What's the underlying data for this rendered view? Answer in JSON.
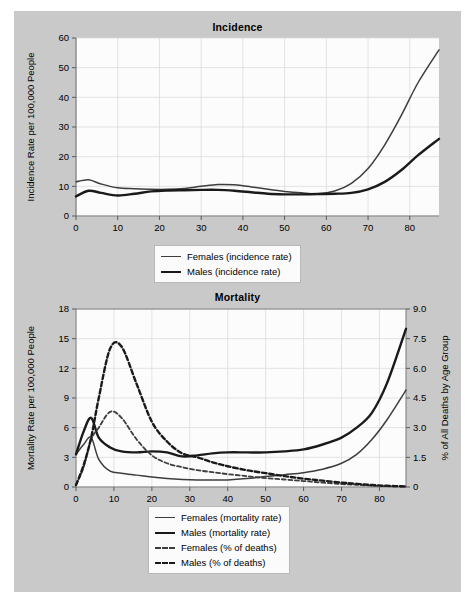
{
  "figure": {
    "background_color": "#c9c9c9",
    "page_color": "#ffffff"
  },
  "charts": {
    "incidence": {
      "title": "Incidence",
      "ylabel": "Incidence Rate per 100,000 People",
      "xlabel": "",
      "yticks": [
        "0",
        "10",
        "20",
        "30",
        "40",
        "50",
        "60"
      ],
      "xticks": [
        "0",
        "10",
        "20",
        "30",
        "40",
        "50",
        "60",
        "70",
        "80"
      ],
      "legend": [
        {
          "label": "Females (incidence rate)",
          "style": "solid-thin",
          "color": "#3d3d3d"
        },
        {
          "label": "Males (incidence rate)",
          "style": "solid-thick",
          "color": "#1a1a1a"
        }
      ]
    },
    "mortality": {
      "title": "Mortality",
      "ylabel": "Mortality Rate per 100,000 People",
      "ylabel_right": "% of All Deaths by Age Group",
      "xlabel": "",
      "yticks": [
        "0",
        "3",
        "6",
        "9",
        "12",
        "15",
        "18"
      ],
      "yticks_right": [
        "0",
        "1.5",
        "3.0",
        "4.5",
        "6.0",
        "7.5",
        "9.0"
      ],
      "xticks": [
        "0",
        "10",
        "20",
        "30",
        "40",
        "50",
        "60",
        "70",
        "80"
      ],
      "legend": [
        {
          "label": "Females (mortality rate)",
          "style": "solid-thin",
          "color": "#3d3d3d"
        },
        {
          "label": "Males (mortality rate)",
          "style": "solid-thick",
          "color": "#1a1a1a"
        },
        {
          "label": "Females (% of deaths)",
          "style": "dashed-thin",
          "color": "#3d3d3d"
        },
        {
          "label": "Males (% of deaths)",
          "style": "dashed-thick",
          "color": "#1a1a1a"
        }
      ]
    }
  },
  "chart_data": [
    {
      "type": "line",
      "title": "Incidence",
      "xlabel": "",
      "ylabel": "Incidence Rate per 100,000 People",
      "xlim": [
        0,
        87
      ],
      "ylim": [
        0,
        60
      ],
      "xticks": [
        0,
        10,
        20,
        30,
        40,
        50,
        60,
        70,
        80
      ],
      "yticks": [
        0,
        10,
        20,
        30,
        40,
        50,
        60
      ],
      "grid": true,
      "legend_position": "below-center",
      "x": [
        0,
        3,
        6,
        10,
        14,
        18,
        22,
        26,
        30,
        34,
        38,
        42,
        46,
        50,
        54,
        58,
        62,
        66,
        70,
        74,
        78,
        82,
        87
      ],
      "series": [
        {
          "name": "Females (incidence rate)",
          "style": "solid-thin",
          "values": [
            11.5,
            12.2,
            10.8,
            9.5,
            9.2,
            9.0,
            9.0,
            9.3,
            10.0,
            10.6,
            10.5,
            9.8,
            9.0,
            8.3,
            7.8,
            7.5,
            8.4,
            11.0,
            16.0,
            24.0,
            34.0,
            45.0,
            56.0
          ]
        },
        {
          "name": "Males (incidence rate)",
          "style": "solid-thick",
          "values": [
            6.6,
            8.5,
            7.8,
            6.9,
            7.5,
            8.3,
            8.6,
            8.7,
            8.8,
            8.8,
            8.5,
            8.0,
            7.5,
            7.3,
            7.3,
            7.4,
            7.5,
            7.8,
            9.0,
            11.5,
            15.5,
            20.5,
            26.0
          ]
        }
      ]
    },
    {
      "type": "line",
      "title": "Mortality",
      "xlabel": "",
      "ylabel": "Mortality Rate per 100,000 People",
      "ylabel_right": "% of All Deaths by Age Group",
      "xlim": [
        0,
        87
      ],
      "ylim": [
        0,
        18
      ],
      "ylim_right": [
        0,
        9
      ],
      "xticks": [
        0,
        10,
        20,
        30,
        40,
        50,
        60,
        70,
        80
      ],
      "yticks": [
        0,
        3,
        6,
        9,
        12,
        15,
        18
      ],
      "yticks_right": [
        0,
        1.5,
        3.0,
        4.5,
        6.0,
        7.5,
        9.0
      ],
      "grid": true,
      "legend_position": "below-center",
      "x": [
        0,
        2,
        4,
        6,
        9,
        12,
        16,
        20,
        24,
        28,
        32,
        36,
        40,
        45,
        50,
        55,
        60,
        65,
        70,
        74,
        78,
        82,
        87
      ],
      "series": [
        {
          "name": "Females (mortality rate)",
          "style": "solid-thin",
          "axis": "left",
          "values": [
            3.3,
            4.3,
            5.0,
            2.8,
            1.6,
            1.4,
            1.2,
            1.0,
            0.85,
            0.75,
            0.7,
            0.7,
            0.72,
            0.85,
            1.05,
            1.25,
            1.45,
            1.8,
            2.4,
            3.3,
            4.8,
            6.8,
            9.8
          ]
        },
        {
          "name": "Males (mortality rate)",
          "style": "solid-thick",
          "axis": "left",
          "values": [
            3.3,
            5.6,
            7.0,
            5.0,
            4.0,
            3.6,
            3.5,
            3.6,
            3.5,
            3.1,
            3.2,
            3.4,
            3.5,
            3.5,
            3.5,
            3.6,
            3.8,
            4.3,
            5.0,
            6.0,
            7.5,
            10.5,
            16.0
          ]
        },
        {
          "name": "Females (% of deaths)",
          "style": "dashed-thin",
          "axis": "right",
          "values": [
            0.1,
            1.0,
            2.4,
            3.0,
            3.8,
            3.5,
            2.4,
            1.6,
            1.2,
            1.0,
            0.85,
            0.75,
            0.65,
            0.55,
            0.45,
            0.38,
            0.3,
            0.22,
            0.15,
            0.11,
            0.07,
            0.04,
            0.02
          ]
        },
        {
          "name": "Males (% of deaths)",
          "style": "dashed-thick",
          "axis": "right",
          "values": [
            0.1,
            1.1,
            2.5,
            4.5,
            7.0,
            7.1,
            5.2,
            3.3,
            2.3,
            1.7,
            1.5,
            1.25,
            1.05,
            0.85,
            0.7,
            0.55,
            0.42,
            0.32,
            0.22,
            0.16,
            0.1,
            0.06,
            0.03
          ]
        }
      ]
    }
  ]
}
